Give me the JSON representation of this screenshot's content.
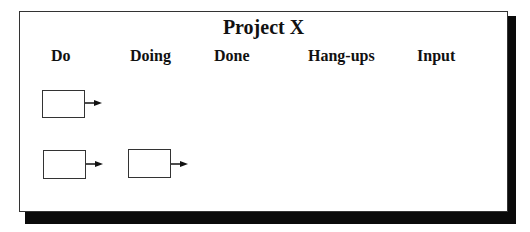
{
  "board": {
    "title": "Project X",
    "columns": [
      {
        "label": "Do"
      },
      {
        "label": "Doing"
      },
      {
        "label": "Done"
      },
      {
        "label": "Hang-ups"
      },
      {
        "label": "Input"
      }
    ],
    "cards": [
      {
        "row": 1,
        "column": "Do",
        "has_arrow": true
      },
      {
        "row": 2,
        "column": "Do",
        "has_arrow": true
      },
      {
        "row": 2,
        "column": "Doing",
        "has_arrow": true
      }
    ]
  },
  "colors": {
    "border": "#333333",
    "shadow": "#0a0a0a",
    "background": "#ffffff",
    "text": "#111111"
  }
}
